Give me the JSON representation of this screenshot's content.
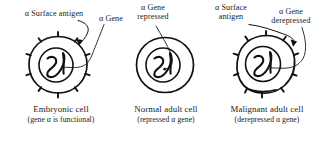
{
  "figure": {
    "ink_color": "#111111",
    "background_color": "#ffffff"
  },
  "annotations": [
    {
      "id": "a-surface-antigen-1",
      "text": "α Surface antigen",
      "lines": [
        "α Surface antigen"
      ]
    },
    {
      "id": "a-gene-1",
      "text": "α Gene",
      "lines": [
        "α Gene"
      ]
    },
    {
      "id": "a-gene-repressed",
      "text": "α Gene repressed",
      "lines": [
        "α Gene",
        "repressed"
      ]
    },
    {
      "id": "a-surface-antigen-2",
      "text": "α Surface antigen",
      "lines": [
        "α Surface",
        "antigen"
      ]
    },
    {
      "id": "a-gene-derepressed",
      "text": "α Gene derepressed",
      "lines": [
        "α Gene",
        "derepressed"
      ]
    }
  ],
  "labels": {
    "a_surface_antigen_1": "α Surface antigen",
    "a_gene_1": "α Gene",
    "a_gene_repressed_line1": "α Gene",
    "a_gene_repressed_line2": "repressed",
    "a_surface_antigen_2_line1": "α Surface",
    "a_surface_antigen_2_line2": "antigen",
    "a_gene_derepressed_line1": "α Gene",
    "a_gene_derepressed_line2": "derepressed"
  },
  "cells": [
    {
      "id": "embryonic-cell",
      "caption_main": "Embryonic cell",
      "caption_sub": "(gene α is functional)",
      "shape": "round",
      "has_surface_antigens": true,
      "antigen_count": 10,
      "nucleus_gene_symbol": "α",
      "gene_state": "functional"
    },
    {
      "id": "normal-adult-cell",
      "caption_main": "Normal adult cell",
      "caption_sub": "(repressed α gene)",
      "shape": "round",
      "has_surface_antigens": false,
      "antigen_count": 0,
      "nucleus_gene_symbol": "α",
      "gene_state": "repressed"
    },
    {
      "id": "malignant-adult-cell",
      "caption_main": "Malignant adult cell",
      "caption_sub": "(derepressed α gene)",
      "shape": "irregular",
      "has_surface_antigens": true,
      "antigen_count": 10,
      "nucleus_gene_symbol": "α",
      "gene_state": "derepressed"
    }
  ]
}
